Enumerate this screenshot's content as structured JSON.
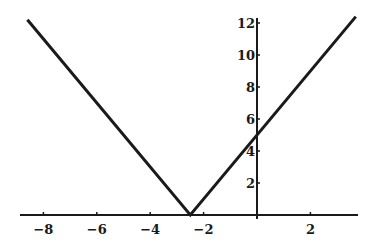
{
  "chart_data": {
    "type": "line",
    "title": "",
    "xlabel": "",
    "ylabel": "",
    "function": "y = |2x + 5|",
    "series": [
      {
        "name": "y = |2x+5|",
        "x": [
          -8.6,
          -2.5,
          3.7
        ],
        "y": [
          12.2,
          0,
          12.4
        ]
      }
    ],
    "xlim": [
      -8.6,
      3.8
    ],
    "ylim": [
      0,
      12.2
    ],
    "x_ticks": [
      -8,
      -6,
      -4,
      -2,
      2
    ],
    "x_tick_labels": [
      "-8",
      "-6",
      "-4",
      "-2",
      "2"
    ],
    "y_ticks": [
      2,
      4,
      6,
      8,
      10,
      12
    ],
    "y_tick_labels": [
      "2",
      "4",
      "6",
      "8",
      "10",
      "12"
    ],
    "grid": false,
    "legend": "none",
    "line_color": "#1a1a1a",
    "background_color": "#ffffff"
  },
  "layout": {
    "x_origin_px": 257,
    "y_origin_px": 215,
    "px_per_x_unit": 26.7,
    "px_per_y_unit": 16,
    "x_axis_start_px": 20,
    "x_axis_end_px": 358,
    "y_axis_top_px": 18
  }
}
